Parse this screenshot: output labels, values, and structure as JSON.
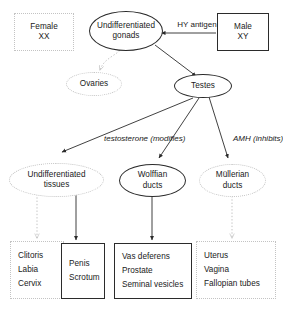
{
  "diagram": {
    "colors": {
      "text": "#1a1a1a",
      "solid_stroke": "#2b2b2b",
      "faint_stroke": "#c3c3c3",
      "background": "#ffffff"
    },
    "nodes": {
      "female": {
        "line1": "Female",
        "line2": "XX",
        "shape": "box",
        "style": "faint"
      },
      "undifferentiated_gonads": {
        "line1": "Undifferentiated",
        "line2": "gonads",
        "shape": "ellipse",
        "style": "solid"
      },
      "male": {
        "line1": "Male",
        "line2": "XY",
        "shape": "box",
        "style": "solid"
      },
      "ovaries": {
        "line1": "Ovaries",
        "shape": "ellipse",
        "style": "faint"
      },
      "testes": {
        "line1": "Testes",
        "shape": "ellipse",
        "style": "solid"
      },
      "undifferentiated_tissues": {
        "line1": "Undifferentiated",
        "line2": "tissues",
        "shape": "ellipse",
        "style": "faint"
      },
      "wolffian_ducts": {
        "line1": "Wolffian",
        "line2": "ducts",
        "shape": "ellipse",
        "style": "solid"
      },
      "mullerian_ducts": {
        "line1": "Müllerian",
        "line2": "ducts",
        "shape": "ellipse",
        "style": "faint"
      }
    },
    "outcome_boxes": {
      "female_external": {
        "style": "faint",
        "items": [
          "Clitoris",
          "Labia",
          "Cervix"
        ]
      },
      "male_external": {
        "style": "solid",
        "items": [
          "Penis",
          "Scrotum"
        ]
      },
      "male_internal": {
        "style": "solid",
        "items": [
          "Vas deferens",
          "Prostate",
          "Seminal vesicles"
        ]
      },
      "female_internal": {
        "style": "faint",
        "items": [
          "Uterus",
          "Vagina",
          "Fallopian tubes"
        ]
      }
    },
    "edge_labels": {
      "hy_antigen_line1": "HY",
      "hy_antigen_line2": "antigen",
      "testosterone_line1": "testosterone",
      "testosterone_line2": "(modifies)",
      "amh_line1": "AMH",
      "amh_line2": "(inhibits)"
    }
  }
}
